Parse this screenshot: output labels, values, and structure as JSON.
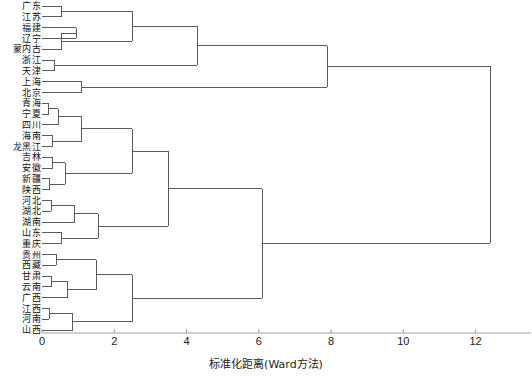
{
  "chart_data": {
    "type": "dendrogram",
    "title": "",
    "xlabel": "标准化距离(Ward方法)",
    "ylabel": "",
    "xlim": [
      0,
      13.2
    ],
    "xticks": [
      0,
      2,
      4,
      6,
      8,
      10,
      12
    ],
    "xticklabels": [
      "0",
      "2",
      "4",
      "6",
      "8",
      "10",
      "12"
    ],
    "grid": false,
    "legend": null,
    "orientation": "left",
    "linkage_method": "Ward",
    "n_leaves": 31,
    "leaf_labels": [
      "广东",
      "江苏",
      "福建",
      "辽宁",
      "内蒙古",
      "浙江",
      "天津",
      "上海",
      "北京",
      "青海",
      "宁夏",
      "四川",
      "海南",
      "黑龙江",
      "吉林",
      "安徽",
      "新疆",
      "陕西",
      "河北",
      "湖北",
      "湖南",
      "山东",
      "重庆",
      "贵州",
      "西藏",
      "甘肃",
      "云南",
      "广西",
      "江西",
      "河南",
      "山西"
    ],
    "leaf_labels_outer": [
      "广",
      "江",
      "福",
      "辽",
      "内蒙",
      "浙",
      "天",
      "上",
      "北",
      "青",
      "宁",
      "四",
      "海",
      "黑龙",
      "吉",
      "安",
      "新",
      "陕",
      "河",
      "湖",
      "湖",
      "山",
      "重",
      "全",
      "西",
      "贵",
      "甘",
      "云",
      "广",
      "江",
      "河",
      "山"
    ],
    "merges": [
      {
        "id": "m1",
        "left": "L0",
        "right": "L1",
        "height": 0.55
      },
      {
        "id": "m2",
        "left": "L2",
        "right": "L3",
        "height": 0.95
      },
      {
        "id": "m3",
        "left": "m2",
        "right": "L4",
        "height": 0.55
      },
      {
        "id": "m4",
        "left": "m1",
        "right": "m3",
        "height": 2.5
      },
      {
        "id": "m5",
        "left": "L5",
        "right": "L6",
        "height": 0.35
      },
      {
        "id": "m6",
        "left": "m4",
        "right": "m5",
        "height": 4.3
      },
      {
        "id": "m7",
        "left": "L7",
        "right": "L8",
        "height": 1.1
      },
      {
        "id": "m8",
        "left": "m6",
        "right": "m7",
        "height": 7.9
      },
      {
        "id": "m9",
        "left": "L9",
        "right": "L10",
        "height": 0.18
      },
      {
        "id": "m10",
        "left": "m9",
        "right": "L11",
        "height": 0.45
      },
      {
        "id": "m11",
        "left": "L12",
        "right": "L13",
        "height": 0.3
      },
      {
        "id": "m12",
        "left": "m10",
        "right": "m11",
        "height": 1.1
      },
      {
        "id": "m13",
        "left": "L14",
        "right": "L15",
        "height": 0.3
      },
      {
        "id": "m14",
        "left": "L16",
        "right": "L17",
        "height": 0.22
      },
      {
        "id": "m15",
        "left": "m13",
        "right": "m14",
        "height": 0.65
      },
      {
        "id": "m16",
        "left": "m12",
        "right": "m15",
        "height": 2.5
      },
      {
        "id": "m17",
        "left": "L18",
        "right": "L19",
        "height": 0.25
      },
      {
        "id": "m18",
        "left": "m17",
        "right": "L20",
        "height": 0.9
      },
      {
        "id": "m19",
        "left": "L21",
        "right": "L22",
        "height": 0.55
      },
      {
        "id": "m20",
        "left": "m18",
        "right": "m19",
        "height": 1.55
      },
      {
        "id": "m21",
        "left": "m16",
        "right": "m20",
        "height": 3.5
      },
      {
        "id": "m22",
        "left": "L23",
        "right": "L24",
        "height": 0.4
      },
      {
        "id": "m23",
        "left": "L25",
        "right": "L26",
        "height": 0.25
      },
      {
        "id": "m24",
        "left": "m23",
        "right": "L27",
        "height": 0.7
      },
      {
        "id": "m25",
        "left": "m22",
        "right": "m24",
        "height": 1.5
      },
      {
        "id": "m26",
        "left": "L28",
        "right": "L29",
        "height": 0.2
      },
      {
        "id": "m27",
        "left": "m26",
        "right": "L30",
        "height": 0.85
      },
      {
        "id": "m28",
        "left": "m25",
        "right": "m27",
        "height": 2.5
      },
      {
        "id": "m29",
        "left": "m21",
        "right": "m28",
        "height": 6.1
      },
      {
        "id": "m30",
        "left": "m8",
        "right": "m29",
        "height": 12.4
      }
    ],
    "line_color": "#4a4a4a",
    "axis_color": "#999999",
    "background": "#ffffff"
  },
  "axis": {
    "tick_label_0": "0",
    "tick_label_2": "2",
    "tick_label_4": "4",
    "tick_label_6": "6",
    "tick_label_8": "8",
    "tick_label_10": "10",
    "tick_label_12": "12",
    "title": "标准化距离(Ward方法)"
  }
}
